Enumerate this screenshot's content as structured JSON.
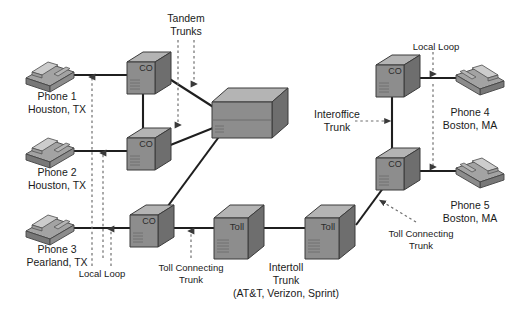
{
  "diagram": {
    "colors": {
      "box_front": "#8d8d8d",
      "box_top": "#b4b4b4",
      "box_side": "#6e6e6e",
      "box_outline": "#3b3b3b",
      "phone_body": "#9a9a9a",
      "phone_top": "#c0c0c0",
      "line": "#1f1f1f",
      "dashed": "#7a7a7a",
      "text": "#1a1a1a",
      "background": "#ffffff"
    },
    "nodes": [
      {
        "id": "co1",
        "label": "CO",
        "type": "central-office",
        "x": 127,
        "y": 52,
        "w": 44,
        "h": 42
      },
      {
        "id": "co2",
        "label": "CO",
        "type": "central-office",
        "x": 127,
        "y": 128,
        "w": 44,
        "h": 42
      },
      {
        "id": "co3",
        "label": "CO",
        "type": "central-office",
        "x": 130,
        "y": 205,
        "w": 44,
        "h": 42
      },
      {
        "id": "tandem",
        "label": "",
        "type": "tandem-switch",
        "x": 212,
        "y": 88,
        "w": 76,
        "h": 50
      },
      {
        "id": "toll1",
        "label": "Toll",
        "type": "toll-switch",
        "x": 214,
        "y": 205,
        "w": 50,
        "h": 54
      },
      {
        "id": "toll2",
        "label": "Toll",
        "type": "toll-switch",
        "x": 305,
        "y": 205,
        "w": 50,
        "h": 54
      },
      {
        "id": "co4",
        "label": "CO",
        "type": "central-office",
        "x": 376,
        "y": 55,
        "w": 44,
        "h": 42
      },
      {
        "id": "co5",
        "label": "CO",
        "type": "central-office",
        "x": 376,
        "y": 148,
        "w": 44,
        "h": 42
      }
    ],
    "phones": [
      {
        "id": "phone1",
        "name_line1": "Phone 1",
        "name_line2": "Houston, TX",
        "x": 26,
        "y": 58,
        "label_x": 57,
        "label_y": 96
      },
      {
        "id": "phone2",
        "name_line1": "Phone 2",
        "name_line2": "Houston, TX",
        "x": 26,
        "y": 134,
        "label_x": 57,
        "label_y": 172
      },
      {
        "id": "phone3",
        "name_line1": "Phone 3",
        "name_line2": "Pearland, TX",
        "x": 26,
        "y": 211,
        "label_x": 57,
        "label_y": 249
      },
      {
        "id": "phone4",
        "name_line1": "Phone 4",
        "name_line2": "Boston, MA",
        "x": 452,
        "y": 62,
        "label_x": 470,
        "label_y": 108
      },
      {
        "id": "phone5",
        "name_line1": "Phone 5",
        "name_line2": "Boston, MA",
        "x": 452,
        "y": 155,
        "label_x": 470,
        "label_y": 200
      }
    ],
    "annotations": [
      {
        "id": "tandem-trunks",
        "line1": "Tandem",
        "line2": "Trunks",
        "x": 174,
        "y": 14
      },
      {
        "id": "local-loop-left",
        "line1": "Local Loop",
        "line2": "",
        "x": 100,
        "y": 272
      },
      {
        "id": "toll-connecting-trunk-left",
        "line1": "Toll Connecting",
        "line2": "Trunk",
        "x": 191,
        "y": 264
      },
      {
        "id": "intertoll-trunk",
        "line1": "Intertoll",
        "line2": "Trunk",
        "x": 284,
        "y": 264
      },
      {
        "id": "intertoll-carriers",
        "line1": "(AT&T, Verizon, Sprint)",
        "line2": "",
        "x": 284,
        "y": 288
      },
      {
        "id": "interoffice-trunk",
        "line1": "Interoffice",
        "line2": "Trunk",
        "x": 337,
        "y": 108
      },
      {
        "id": "local-loop-right",
        "line1": "Local Loop",
        "line2": "",
        "x": 436,
        "y": 44
      },
      {
        "id": "toll-connecting-trunk-right",
        "line1": "Toll Connecting",
        "line2": "Trunk",
        "x": 421,
        "y": 229
      }
    ],
    "links": [
      {
        "from": "phone1",
        "to": "co1",
        "kind": "local-loop"
      },
      {
        "from": "phone2",
        "to": "co2",
        "kind": "local-loop"
      },
      {
        "from": "phone3",
        "to": "co3",
        "kind": "local-loop"
      },
      {
        "from": "co1",
        "to": "co2",
        "kind": "interoffice-trunk"
      },
      {
        "from": "co1",
        "to": "tandem",
        "kind": "tandem-trunk"
      },
      {
        "from": "co2",
        "to": "tandem",
        "kind": "tandem-trunk"
      },
      {
        "from": "co3",
        "to": "tandem",
        "kind": "tandem-trunk"
      },
      {
        "from": "co3",
        "to": "toll1",
        "kind": "toll-connecting-trunk"
      },
      {
        "from": "toll1",
        "to": "toll2",
        "kind": "intertoll-trunk"
      },
      {
        "from": "toll2",
        "to": "co5",
        "kind": "toll-connecting-trunk"
      },
      {
        "from": "co4",
        "to": "co5",
        "kind": "interoffice-trunk"
      },
      {
        "from": "co4",
        "to": "phone4",
        "kind": "local-loop"
      },
      {
        "from": "co5",
        "to": "phone5",
        "kind": "local-loop"
      }
    ]
  }
}
